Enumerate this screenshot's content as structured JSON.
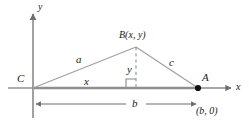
{
  "figure": {
    "kind": "geometry-diagram",
    "colors": {
      "axis": "#8a8a8a",
      "baseline": "#8a8a8a",
      "triangle_leg": "#9a9a9a",
      "dashed": "#9a9a9a",
      "dimension": "#6f6f6f",
      "text": "#1a1a1a",
      "point_fill": "#111111",
      "background": "#ffffff"
    },
    "axes": {
      "y_label": "y",
      "x_label": "x"
    },
    "vertices": [
      {
        "name": "C",
        "label": "C",
        "x": 33,
        "y": 88
      },
      {
        "name": "A",
        "label": "A",
        "x": 198,
        "y": 88
      },
      {
        "name": "B",
        "label": "B(x, y)",
        "x": 136,
        "y": 47
      }
    ],
    "point_coordinates": {
      "A": "(b, 0)"
    },
    "side_labels": {
      "left_leg": "a",
      "right_leg": "c",
      "base_segment": "x",
      "altitude": "y",
      "base_dimension": "b"
    },
    "markers": {
      "right_angle": "right-angle-square"
    }
  }
}
